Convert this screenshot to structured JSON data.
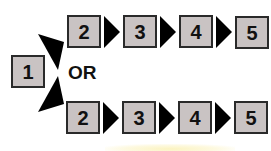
{
  "diagram": {
    "start": {
      "label": "1"
    },
    "connector_text": "OR",
    "top_path": {
      "steps": [
        "2",
        "3",
        "4",
        "5"
      ]
    },
    "bottom_path": {
      "steps": [
        "2",
        "3",
        "4",
        "5"
      ]
    },
    "colors": {
      "box_fill": "#c9c3c3",
      "box_border": "#2a2a2a",
      "arrow": "#000000",
      "background": "#ffffff"
    }
  }
}
